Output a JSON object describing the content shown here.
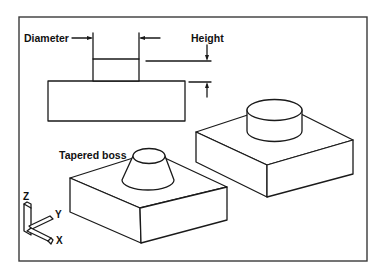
{
  "diagram": {
    "frame": {
      "border_color": "#3a3a3a",
      "background": "#ffffff"
    },
    "side_view": {
      "labels": {
        "diameter": "Diameter",
        "height": "Height"
      }
    },
    "isometric_views": {
      "tapered_label": "Tapered boss"
    },
    "axis_triad": {
      "z_label": "Z",
      "y_label": "Y",
      "x_label": "X"
    }
  }
}
